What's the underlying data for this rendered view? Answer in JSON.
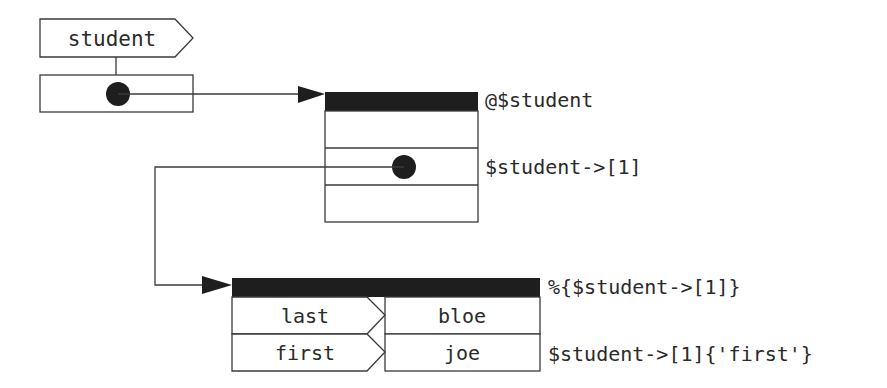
{
  "variable": {
    "name": "student"
  },
  "array": {
    "label": "@$student",
    "element_label": "$student->[1]",
    "row_count": 3,
    "pointer_row": 1
  },
  "hash": {
    "label": "%{$student->[1]}",
    "entry_label": "$student->[1]{'first'}",
    "entries": [
      {
        "key": "last",
        "value": "bloe"
      },
      {
        "key": "first",
        "value": "joe"
      }
    ]
  },
  "colors": {
    "line": "#3a3a3a",
    "fill_dark": "#1e1e1e",
    "background": "#ffffff"
  }
}
